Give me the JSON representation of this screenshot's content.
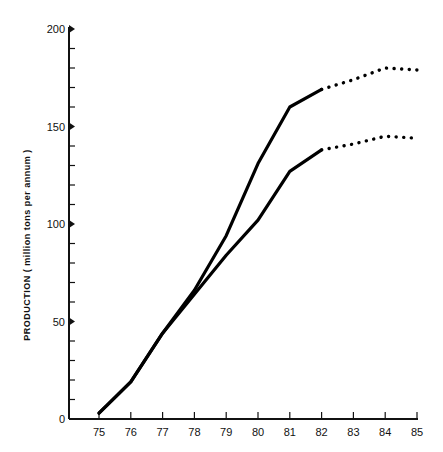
{
  "chart_data": {
    "type": "line",
    "title": "",
    "xlabel": "",
    "ylabel": "PRODUCTION ( million tons per annum )",
    "x": [
      75,
      76,
      77,
      78,
      79,
      80,
      81,
      82,
      83,
      84,
      85
    ],
    "x_tick_labels": [
      "75",
      "76",
      "77",
      "78",
      "79",
      "80",
      "81",
      "82",
      "83",
      "84",
      "85"
    ],
    "y_tick_labels": [
      "0",
      "50",
      "100",
      "150",
      "200"
    ],
    "ylim": [
      0,
      200
    ],
    "xlim": [
      74.1,
      85
    ],
    "grid": false,
    "legend": null,
    "series": [
      {
        "name": "Upper estimate",
        "style": "solid",
        "x": [
          75,
          76,
          77,
          78,
          79,
          80,
          81,
          82
        ],
        "values": [
          3,
          19,
          44,
          66,
          94,
          131,
          160,
          169
        ]
      },
      {
        "name": "Upper estimate (projected)",
        "style": "dotted",
        "x": [
          82,
          83,
          84,
          85
        ],
        "values": [
          169,
          174,
          180,
          179
        ]
      },
      {
        "name": "Lower estimate",
        "style": "solid",
        "x": [
          75,
          76,
          77,
          78,
          79,
          80,
          81,
          82
        ],
        "values": [
          3,
          19,
          44,
          64,
          84,
          102,
          127,
          138
        ]
      },
      {
        "name": "Lower estimate (projected)",
        "style": "dotted",
        "x": [
          82,
          83,
          84,
          85
        ],
        "values": [
          138,
          141,
          145,
          144
        ]
      }
    ]
  }
}
